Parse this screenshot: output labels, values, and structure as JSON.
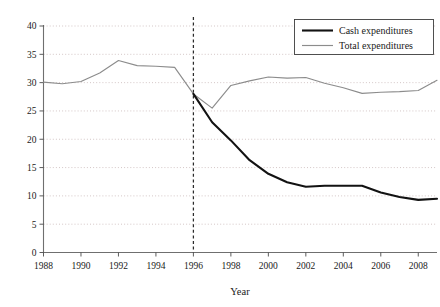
{
  "chart_data": {
    "type": "line",
    "title": "",
    "xlabel": "Year",
    "ylabel": "",
    "xlim": [
      1988,
      2009
    ],
    "ylim": [
      0,
      40
    ],
    "grid": true,
    "legend_position": "top-right",
    "xticks": [
      1988,
      1990,
      1992,
      1994,
      1996,
      1998,
      2000,
      2002,
      2004,
      2006,
      2008
    ],
    "xtick_labels": [
      "1988",
      "1990",
      "1992",
      "1994",
      "1996",
      "1998",
      "2000",
      "2002",
      "2004",
      "2006",
      "2008"
    ],
    "yticks": [
      0,
      5,
      10,
      15,
      20,
      25,
      30,
      35,
      40
    ],
    "ytick_labels": [
      "0",
      "5",
      "10",
      "15",
      "20",
      "25",
      "30",
      "35",
      "40"
    ],
    "x": [
      1988,
      1989,
      1990,
      1991,
      1992,
      1993,
      1994,
      1995,
      1996,
      1997,
      1998,
      1999,
      2000,
      2001,
      2002,
      2003,
      2004,
      2005,
      2006,
      2007,
      2008,
      2009
    ],
    "series": [
      {
        "name": "Cash expenditures",
        "color": "#121212",
        "style": "thick-solid",
        "values": [
          30.1,
          29.8,
          30.2,
          31.7,
          33.9,
          33.0,
          32.9,
          32.7,
          28.0,
          23.0,
          19.8,
          16.3,
          13.9,
          12.4,
          11.6,
          11.8,
          11.8,
          11.8,
          10.6,
          9.8,
          9.3,
          9.5
        ],
        "visible_from": 1996
      },
      {
        "name": "Total expenditures",
        "color": "#8c8c8c",
        "style": "thin-solid",
        "values": [
          30.1,
          29.8,
          30.2,
          31.7,
          33.9,
          33.0,
          32.9,
          32.7,
          28.0,
          25.5,
          29.5,
          30.3,
          31.0,
          30.8,
          30.9,
          29.9,
          29.1,
          28.1,
          28.3,
          28.4,
          28.6,
          30.4
        ]
      }
    ],
    "annotations": [
      {
        "type": "vertical-reference-line",
        "x": 1996,
        "style": "dashed",
        "color": "#2b2b2b"
      }
    ]
  },
  "legend": {
    "entries": [
      {
        "label": "Cash expenditures"
      },
      {
        "label": "Total expenditures"
      }
    ]
  },
  "axes": {
    "x_title": "Year"
  }
}
